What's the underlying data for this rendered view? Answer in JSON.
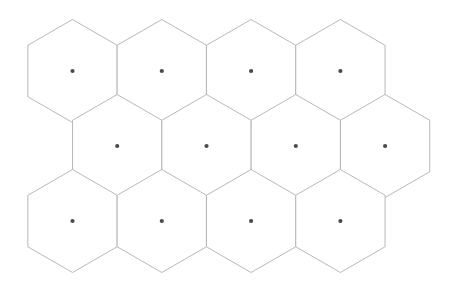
{
  "diagram": {
    "type": "hexagonal-grid",
    "orientation": "pointy-top",
    "rows": 3,
    "columns_per_row": [
      4,
      4,
      4
    ],
    "total_cells": 12,
    "background_color": "#ffffff",
    "stroke_color": "#b0b0b0",
    "stroke_width": 0.9,
    "dot_color": "#4a4a4a",
    "dot_radius": 2.1,
    "geometry": {
      "hex_width": 89.3,
      "hex_height": 103.0,
      "row_spacing": 75.0,
      "column_spacing": 89.3,
      "row_offset": 44.65,
      "canvas_width": 458,
      "canvas_height": 284
    },
    "cells": [
      {
        "id": "r1c1",
        "row": 1,
        "col": 1,
        "cx": 72.5,
        "cy": 71.0
      },
      {
        "id": "r1c2",
        "row": 1,
        "col": 2,
        "cx": 161.8,
        "cy": 71.0
      },
      {
        "id": "r1c3",
        "row": 1,
        "col": 3,
        "cx": 251.1,
        "cy": 71.0
      },
      {
        "id": "r1c4",
        "row": 1,
        "col": 4,
        "cx": 340.4,
        "cy": 71.0
      },
      {
        "id": "r2c1",
        "row": 2,
        "col": 1,
        "cx": 117.2,
        "cy": 146.0
      },
      {
        "id": "r2c2",
        "row": 2,
        "col": 2,
        "cx": 206.5,
        "cy": 146.0
      },
      {
        "id": "r2c3",
        "row": 2,
        "col": 3,
        "cx": 295.8,
        "cy": 146.0
      },
      {
        "id": "r2c4",
        "row": 2,
        "col": 4,
        "cx": 385.1,
        "cy": 146.0
      },
      {
        "id": "r3c1",
        "row": 3,
        "col": 1,
        "cx": 72.5,
        "cy": 221.0
      },
      {
        "id": "r3c2",
        "row": 3,
        "col": 2,
        "cx": 161.8,
        "cy": 221.0
      },
      {
        "id": "r3c3",
        "row": 3,
        "col": 3,
        "cx": 251.1,
        "cy": 221.0
      },
      {
        "id": "r3c4",
        "row": 3,
        "col": 4,
        "cx": 340.4,
        "cy": 221.0
      }
    ]
  }
}
